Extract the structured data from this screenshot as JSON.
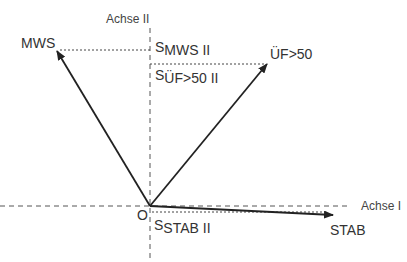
{
  "diagram": {
    "type": "vector-projection",
    "axes": {
      "horizontal": {
        "label": "Achse I"
      },
      "vertical": {
        "label": "Achse II"
      },
      "origin_label": "O"
    },
    "vectors": [
      {
        "name": "MWS",
        "label": "MWS",
        "projection_label_prefix": "S",
        "projection_label_sub": "MWS II"
      },
      {
        "name": "UF50",
        "label": "ÜF>50",
        "projection_label_prefix": "S",
        "projection_label_sub": "ÜF>50 II"
      },
      {
        "name": "STAB",
        "label": "STAB",
        "projection_label_prefix": "S",
        "projection_label_sub": "STAB II"
      }
    ],
    "colors": {
      "line": "#222222",
      "axis": "#555555",
      "text": "#333333",
      "background": "#ffffff"
    }
  }
}
